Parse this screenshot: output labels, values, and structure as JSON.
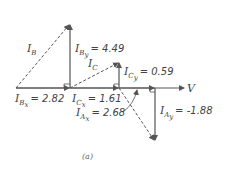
{
  "diagram": {
    "caption": "(a)",
    "reference": {
      "label": "V"
    },
    "labels": {
      "IB": {
        "main": "I",
        "sub": "B"
      },
      "IBy": {
        "main": "I",
        "sub": "B",
        "subsub": "y",
        "value": "= 4.49"
      },
      "IBx": {
        "main": "I",
        "sub": "B",
        "subsub": "x",
        "value": "= 2.82"
      },
      "IC": {
        "main": "I",
        "sub": "C"
      },
      "ICy": {
        "main": "I",
        "sub": "C",
        "subsub": "y",
        "value": "= 0.59"
      },
      "ICx": {
        "main": "I",
        "sub": "C",
        "subsub": "x",
        "value": "= 1.61"
      },
      "IAx": {
        "main": "I",
        "sub": "A",
        "subsub": "x",
        "value": "= 2.68"
      },
      "IAy": {
        "main": "I",
        "sub": "A",
        "subsub": "y",
        "value": "= -1.88"
      }
    },
    "colors": {
      "line": "#555555",
      "text": "#444444"
    }
  }
}
